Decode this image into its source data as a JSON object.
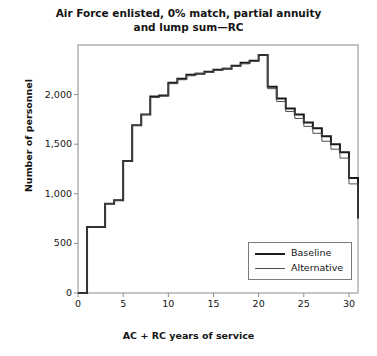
{
  "chart_data": {
    "type": "line",
    "step": true,
    "title": "Air Force enlisted, 0% match, partial annuity and lump sum—RC",
    "title_line1": "Air Force enlisted, 0% match, partial annuity",
    "title_line2": "and lump sum—RC",
    "xlabel": "AC + RC years of service",
    "ylabel": "Number of personnel",
    "xlim": [
      0,
      31
    ],
    "ylim": [
      0,
      2500
    ],
    "xticks": [
      0,
      5,
      10,
      15,
      20,
      25,
      30
    ],
    "xticklabels": [
      "0",
      "5",
      "10",
      "15",
      "20",
      "25",
      "30"
    ],
    "yticks": [
      0,
      500,
      1000,
      1500,
      2000
    ],
    "yticklabels": [
      "0",
      "500",
      "1,000",
      "1,500",
      "2,000"
    ],
    "grid": false,
    "legend_position": "lower right",
    "x": [
      0,
      1,
      2,
      3,
      4,
      5,
      6,
      7,
      8,
      9,
      10,
      11,
      12,
      13,
      14,
      15,
      16,
      17,
      18,
      19,
      20,
      21,
      22,
      23,
      24,
      25,
      26,
      27,
      28,
      29,
      30
    ],
    "series": [
      {
        "name": "Baseline",
        "color": "#1a1a1a",
        "linewidth": 2.0,
        "values": [
          0,
          665,
          665,
          900,
          935,
          1330,
          1690,
          1800,
          1980,
          1990,
          2120,
          2160,
          2200,
          2210,
          2230,
          2250,
          2260,
          2290,
          2320,
          2340,
          2400,
          2080,
          1960,
          1860,
          1800,
          1720,
          1660,
          1580,
          1500,
          1420,
          1160
        ]
      },
      {
        "name": "Alternative",
        "color": "#4d4d4d",
        "linewidth": 1.0,
        "values": [
          0,
          665,
          665,
          900,
          935,
          1330,
          1690,
          1800,
          1970,
          1985,
          2110,
          2150,
          2190,
          2215,
          2225,
          2245,
          2265,
          2285,
          2310,
          2335,
          2400,
          2060,
          1930,
          1830,
          1760,
          1680,
          1610,
          1530,
          1450,
          1360,
          1100
        ]
      }
    ],
    "legend": [
      {
        "label": "Baseline",
        "color": "#1a1a1a",
        "linewidth": 2.0
      },
      {
        "label": "Alternative",
        "color": "#4d4d4d",
        "linewidth": 1.0
      }
    ],
    "final_drop_value": 750
  }
}
